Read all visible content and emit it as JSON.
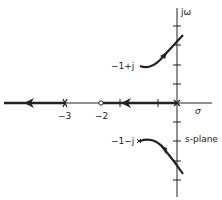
{
  "diagram": {
    "type": "root-locus",
    "colors": {
      "ink": "#222222",
      "background": "#ffffff"
    },
    "axes": {
      "real_label": "σ",
      "imag_label": "jω",
      "plane_label": "s-plane"
    },
    "real_ticks": [
      {
        "value": -3,
        "label": "−3"
      },
      {
        "value": -2,
        "label": "−2"
      }
    ],
    "poles": [
      {
        "id": "pole-origin",
        "label": "",
        "re": 0,
        "im": 0
      },
      {
        "id": "pole-minus-3",
        "label": "",
        "re": -3,
        "im": 0
      },
      {
        "id": "pole-upper",
        "label": "−1+j",
        "re": -1,
        "im": 1
      },
      {
        "id": "pole-lower",
        "label": "−1−j",
        "re": -1,
        "im": -1
      }
    ],
    "zeros": [
      {
        "id": "zero-minus-2",
        "re": -2,
        "im": 0
      }
    ],
    "branches": [
      {
        "id": "branch-real-right",
        "from": "0",
        "to": "-2",
        "direction": "left"
      },
      {
        "id": "branch-real-left",
        "from": "-3",
        "to": "-infinity",
        "direction": "left"
      },
      {
        "id": "branch-upper",
        "from": "-1+j",
        "direction": "up-right, crossing jω axis"
      },
      {
        "id": "branch-lower",
        "from": "-1-j",
        "direction": "down-right, crossing jω axis"
      }
    ]
  }
}
